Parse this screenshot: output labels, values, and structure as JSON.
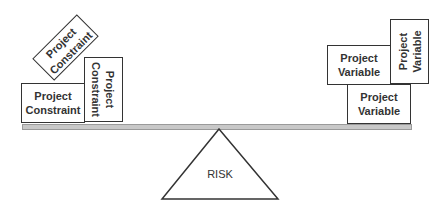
{
  "left": {
    "rotated_box": {
      "label": "Project\nConstraint"
    },
    "flat_box": {
      "label": "Project\nConstraint"
    },
    "vertical_box": {
      "label": "Project\nConstraint"
    }
  },
  "right": {
    "top_box": {
      "label": "Project\nVariable"
    },
    "vertical_box": {
      "label": "Project\nVariable"
    },
    "bottom_box": {
      "label": "Project\nVariable"
    }
  },
  "fulcrum": {
    "label": "RISK"
  },
  "colors": {
    "beam": "#c8c8c8",
    "stroke": "#333333"
  }
}
